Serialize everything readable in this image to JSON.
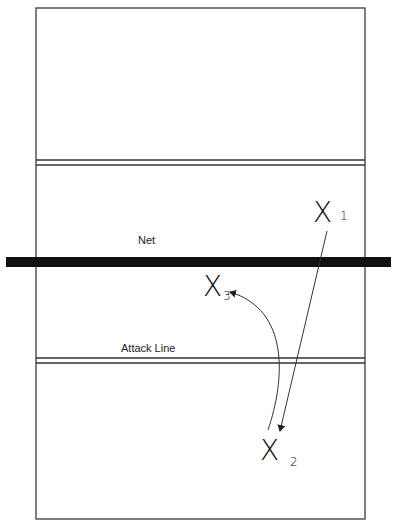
{
  "diagram": {
    "labels": {
      "net": "Net",
      "attack_line": "Attack Line"
    },
    "players": [
      {
        "id": "1",
        "symbol": "X",
        "subscript": "1"
      },
      {
        "id": "2",
        "symbol": "X",
        "subscript": "2"
      },
      {
        "id": "3",
        "symbol": "X",
        "subscript": "3"
      }
    ],
    "movements": [
      {
        "from": "X1",
        "to": "X2",
        "type": "straight-arrow"
      },
      {
        "from": "X2",
        "to": "X3",
        "type": "curved-arrow"
      }
    ],
    "colors": {
      "lines": "#333333",
      "net": "#111111",
      "background": "#ffffff"
    }
  }
}
